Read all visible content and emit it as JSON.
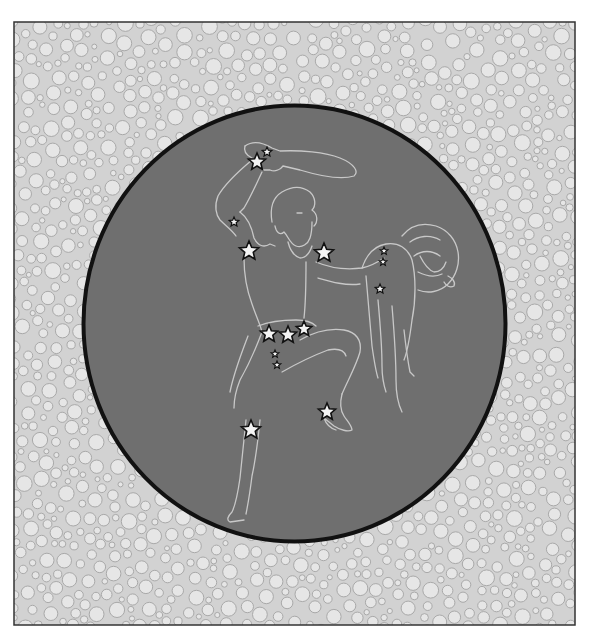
{
  "figure": {
    "frame": {
      "x": 14,
      "y": 22,
      "width": 561,
      "height": 603,
      "border_color": "#333333"
    },
    "background_pattern": {
      "fill": "#e6e6e6",
      "stroke": "#a9a9a9",
      "min_r": 4,
      "max_r": 8
    },
    "sky_disc": {
      "cx": 294.5,
      "cy": 323.5,
      "rx": 211,
      "ry": 218,
      "fill": "#6f6f6f",
      "stroke": "#111111",
      "stroke_width": 4
    },
    "line_color": "#c8c8c8",
    "star_fill": "#f4f4f4",
    "star_stroke": "#111111",
    "stars": [
      {
        "name": "club-star-1",
        "x": 257,
        "y": 162,
        "r": 9
      },
      {
        "name": "club-star-2",
        "x": 267,
        "y": 152,
        "r": 5
      },
      {
        "name": "arm-star",
        "x": 234,
        "y": 222,
        "r": 5
      },
      {
        "name": "betelgeuse",
        "x": 249,
        "y": 251,
        "r": 10
      },
      {
        "name": "bellatrix",
        "x": 324,
        "y": 253,
        "r": 10
      },
      {
        "name": "shield-star-1",
        "x": 384,
        "y": 251,
        "r": 4
      },
      {
        "name": "shield-star-2",
        "x": 383,
        "y": 262,
        "r": 4
      },
      {
        "name": "shield-star-3",
        "x": 380,
        "y": 289,
        "r": 5
      },
      {
        "name": "belt-alnitak",
        "x": 269,
        "y": 334,
        "r": 9
      },
      {
        "name": "belt-alnilam",
        "x": 288,
        "y": 335,
        "r": 9
      },
      {
        "name": "belt-mintaka",
        "x": 304,
        "y": 329,
        "r": 8
      },
      {
        "name": "sword-star-1",
        "x": 275,
        "y": 354,
        "r": 4
      },
      {
        "name": "sword-star-2",
        "x": 277,
        "y": 365,
        "r": 4
      },
      {
        "name": "rigel",
        "x": 251,
        "y": 430,
        "r": 10
      },
      {
        "name": "saiph",
        "x": 327,
        "y": 412,
        "r": 9
      }
    ]
  }
}
